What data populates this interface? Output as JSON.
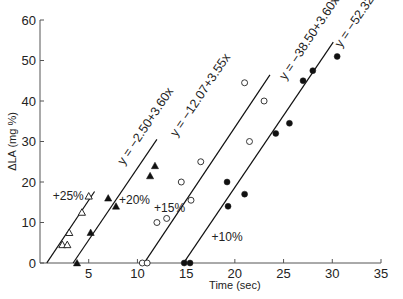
{
  "chart_data": {
    "type": "scatter",
    "title": "",
    "xlabel": "Time (sec)",
    "ylabel": "ΔLA (mg %)",
    "xlim": [
      0,
      35
    ],
    "ylim": [
      0,
      60
    ],
    "xticks": [
      5,
      10,
      15,
      20,
      25,
      30,
      35
    ],
    "yticks": [
      0,
      10,
      20,
      30,
      40,
      50,
      60
    ],
    "grid": false,
    "series": [
      {
        "name": "+25%",
        "marker": "open-triangle",
        "fit_equation": "y = −2.50+3.60x",
        "fit": {
          "intercept": -2.5,
          "slope": 3.6,
          "x_range": [
            0.7,
            5.6
          ]
        },
        "points": [
          [
            2.3,
            4.5
          ],
          [
            2.8,
            4.5
          ],
          [
            3.0,
            7.5
          ],
          [
            4.3,
            12.5
          ],
          [
            5.0,
            16.5
          ]
        ]
      },
      {
        "name": "+20%",
        "marker": "filled-triangle",
        "fit_equation": "y = −12.07+3.55x",
        "fit": {
          "intercept": -12.07,
          "slope": 3.55,
          "x_range": [
            3.4,
            12.0
          ]
        },
        "points": [
          [
            3.8,
            0
          ],
          [
            5.2,
            7.5
          ],
          [
            7.0,
            16
          ],
          [
            7.8,
            14
          ],
          [
            11.3,
            21.5
          ],
          [
            11.8,
            24
          ]
        ]
      },
      {
        "name": "+15%",
        "marker": "open-circle",
        "fit_equation": "y = −38.50+3.60x",
        "fit": {
          "intercept": -38.5,
          "slope": 3.6,
          "x_range": [
            10.7,
            23.6
          ]
        },
        "points": [
          [
            10.5,
            0
          ],
          [
            11.0,
            0
          ],
          [
            12.0,
            10
          ],
          [
            13.0,
            11
          ],
          [
            14.5,
            20
          ],
          [
            15.5,
            15.5
          ],
          [
            16.5,
            25
          ],
          [
            21.0,
            44.5
          ],
          [
            21.5,
            30
          ],
          [
            23.0,
            40
          ]
        ]
      },
      {
        "name": "+10%",
        "marker": "filled-circle",
        "fit_equation": "y = −52.32+3.55x",
        "fit": {
          "intercept": -52.32,
          "slope": 3.55,
          "x_range": [
            14.8,
            30.1
          ]
        },
        "points": [
          [
            14.8,
            0
          ],
          [
            15.4,
            0
          ],
          [
            19.2,
            20
          ],
          [
            19.3,
            14
          ],
          [
            21.0,
            17
          ],
          [
            24.2,
            32
          ],
          [
            25.6,
            34.5
          ],
          [
            27.0,
            45
          ],
          [
            28.0,
            47.5
          ],
          [
            30.5,
            51
          ]
        ]
      }
    ],
    "annotations": [
      {
        "text": "+25%",
        "x": 2.9,
        "y": 16.5
      },
      {
        "text": "+20%",
        "x": 9.7,
        "y": 15.5
      },
      {
        "text": "+15%",
        "x": 13.3,
        "y": 13.5
      },
      {
        "text": "+10%",
        "x": 19.2,
        "y": 6.5
      }
    ]
  }
}
